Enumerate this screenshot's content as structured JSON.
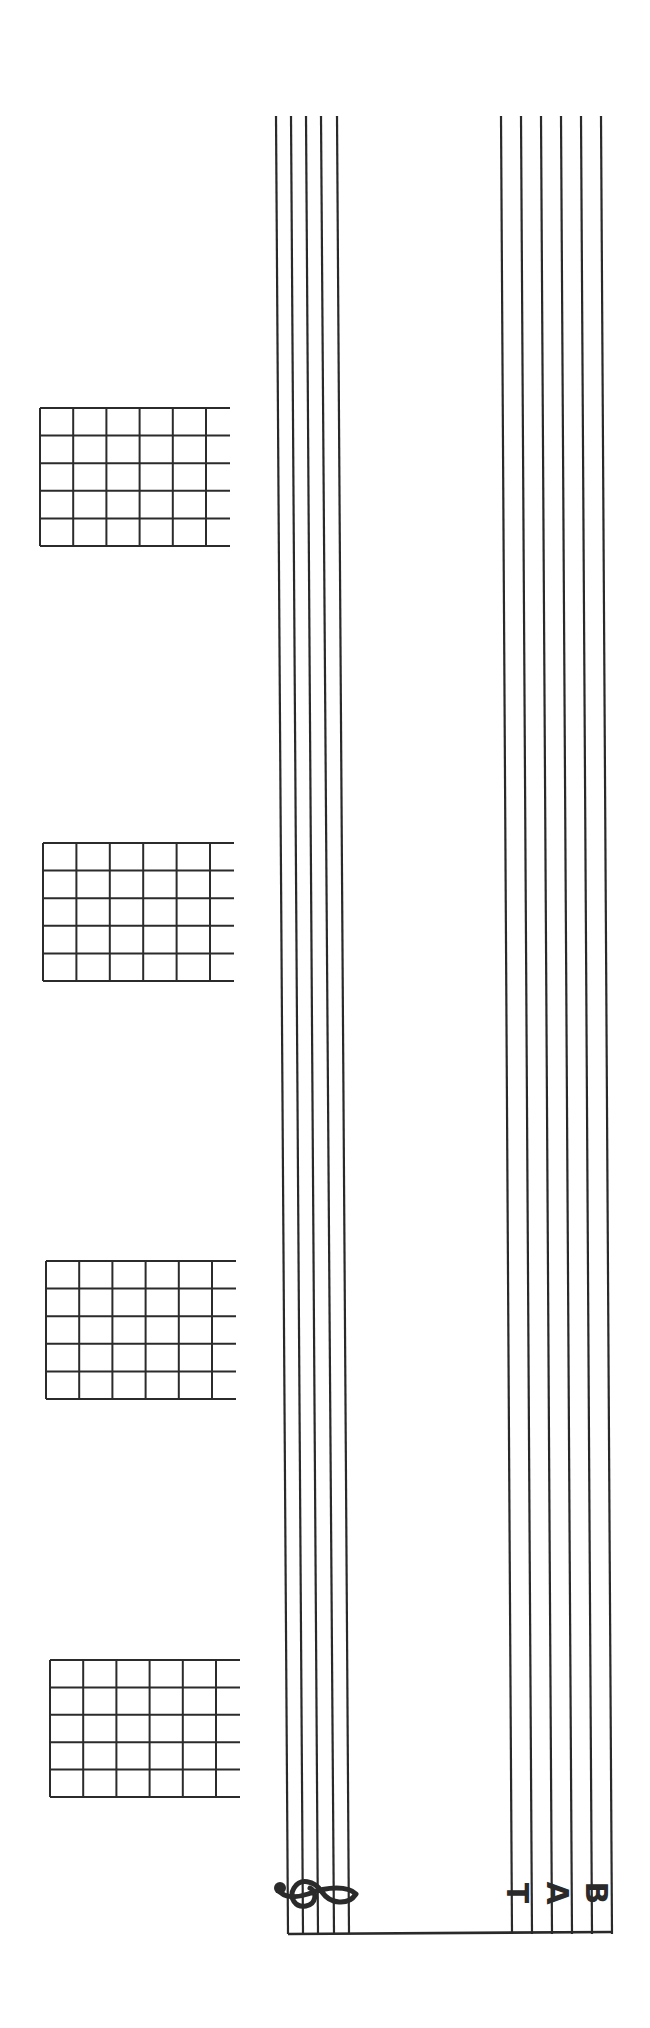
{
  "page": {
    "type": "blank guitar tablature sheet",
    "orientation": "rotated 90 degrees clockwise",
    "ink_color": "#2a2a2a",
    "background": "#ffffff"
  },
  "staff": {
    "clef": "treble-clef",
    "line_count": 5,
    "top_x": [
      276,
      291,
      306,
      321,
      337
    ],
    "bottom_x": [
      288,
      303,
      318,
      334,
      349
    ],
    "y_start": 116,
    "y_end": 1934
  },
  "tab": {
    "label_letters": [
      "T",
      "A",
      "B"
    ],
    "line_count": 6,
    "top_x": [
      501,
      521,
      541,
      561,
      581,
      601
    ],
    "bottom_x": [
      512,
      532,
      552,
      572,
      592,
      612
    ],
    "y_start": 116,
    "y_end": 1934
  },
  "chord_grids": [
    {
      "id": "chord-grid-1",
      "x": 40,
      "y": 408,
      "width": 190,
      "height": 138,
      "strings": 6,
      "frets": 5
    },
    {
      "id": "chord-grid-2",
      "x": 43,
      "y": 843,
      "width": 191,
      "height": 138,
      "strings": 6,
      "frets": 5
    },
    {
      "id": "chord-grid-3",
      "x": 46,
      "y": 1261,
      "width": 190,
      "height": 138,
      "strings": 6,
      "frets": 5
    },
    {
      "id": "chord-grid-4",
      "x": 50,
      "y": 1660,
      "width": 190,
      "height": 137,
      "strings": 6,
      "frets": 5
    }
  ]
}
